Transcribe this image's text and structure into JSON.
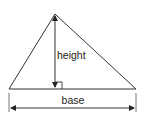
{
  "diagram": {
    "type": "triangle-area-labels",
    "labels": {
      "height": "height",
      "base": "base"
    },
    "colors": {
      "stroke": "#333333",
      "background": "#ffffff",
      "text": "#222222"
    },
    "elements": [
      "triangle",
      "height-line",
      "right-angle-marker",
      "base-dimension-arrow"
    ]
  }
}
